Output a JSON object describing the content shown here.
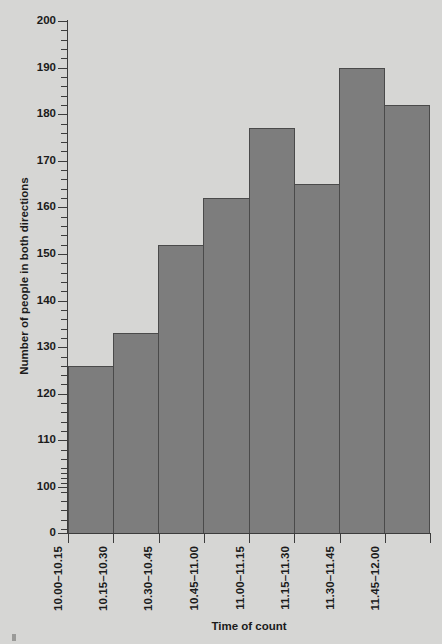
{
  "chart_data": {
    "type": "bar",
    "title": "",
    "xlabel": "Time of count",
    "ylabel": "Number of people in both directions",
    "categories": [
      "10.00–10.15",
      "10.15–10.30",
      "10.30–10.45",
      "10.45–11.00",
      "11.00–11.15",
      "11.15–11.30",
      "11.30–11.45",
      "11.45–12.00"
    ],
    "values": [
      126,
      133,
      152,
      162,
      177,
      165,
      190,
      182
    ],
    "ylim": [
      0,
      200
    ],
    "y_axis_break": true,
    "y_axis_break_note": "axis jumps from 0 to 100",
    "y_tick_labels": [
      "0",
      "100",
      "110",
      "120",
      "130",
      "140",
      "150",
      "160",
      "170",
      "180",
      "190",
      "200"
    ],
    "y_major_step": 10,
    "y_minor_step": 2,
    "grid": false,
    "legend": "none",
    "bar_fill": "#7d7d7d",
    "bar_stroke": "#4a4a4a",
    "background": "#d6d6d4",
    "axis_color": "#3c3c3c",
    "text_color": "#1b1b1b"
  }
}
